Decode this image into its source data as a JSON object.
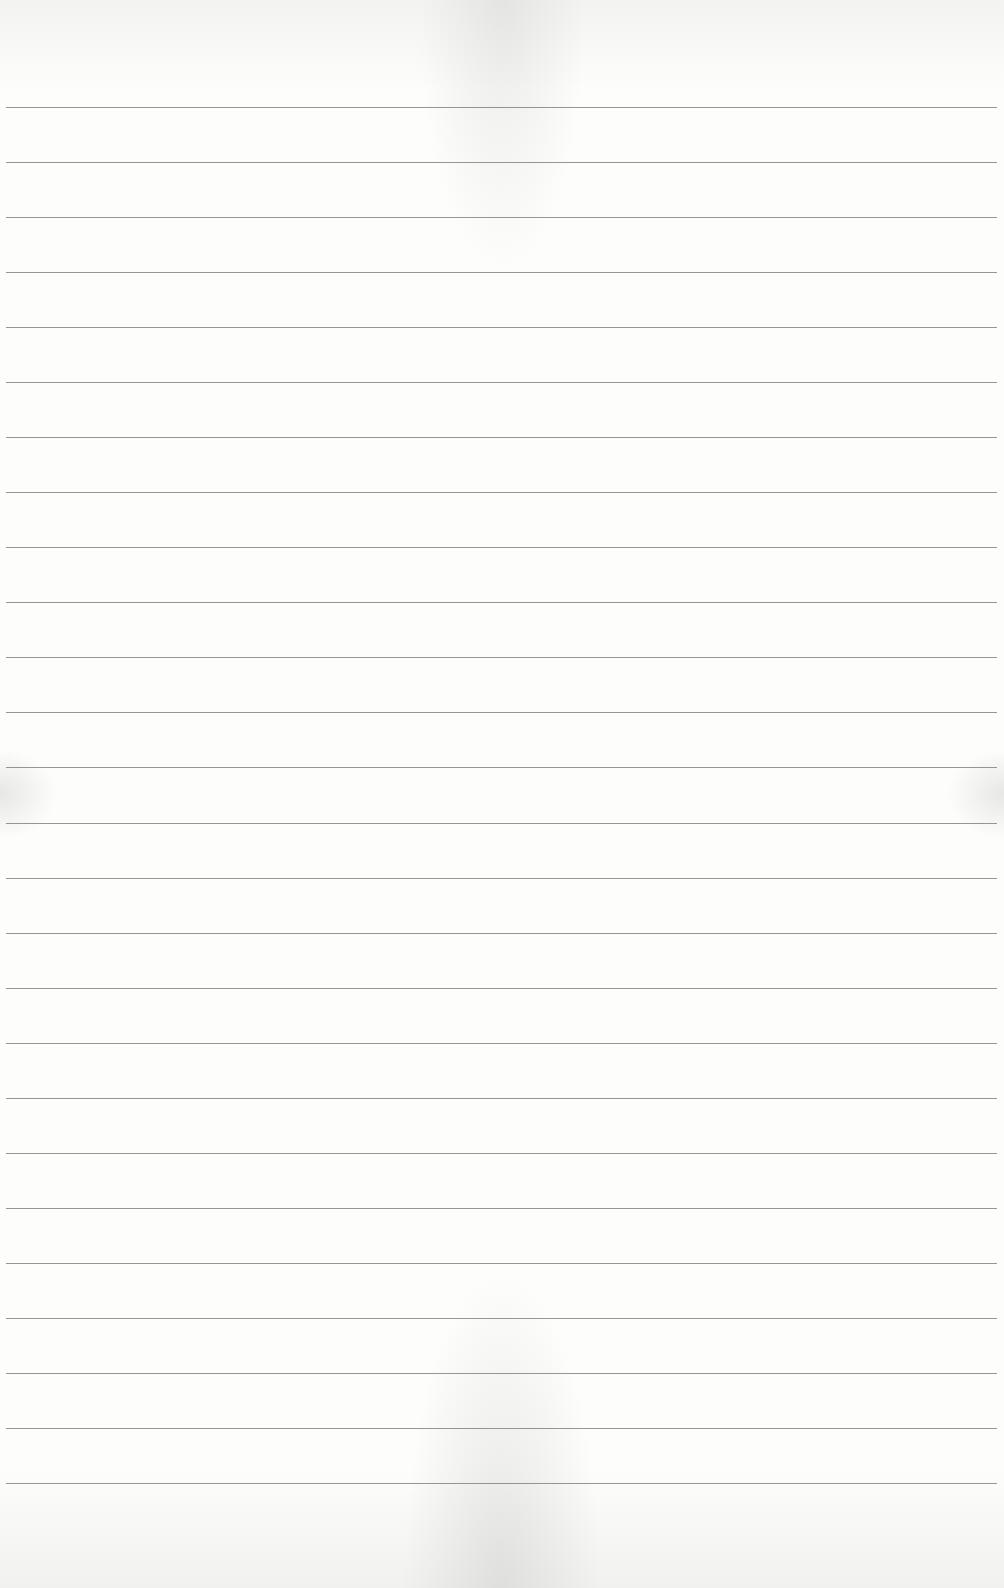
{
  "page": {
    "type": "ruled-notepad-sheet",
    "background_color": "#fbfbfa",
    "line_color": "#8a8a8a",
    "line_count": 26,
    "first_line_y": 107,
    "line_spacing": 55.04,
    "line_left": 6,
    "line_right": 997,
    "text_content": ""
  }
}
